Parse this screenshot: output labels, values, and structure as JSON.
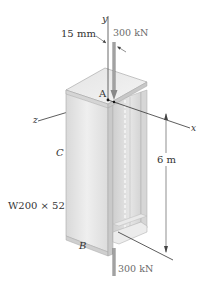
{
  "figure": {
    "type": "engineering-diagram"
  },
  "labels": {
    "y_axis": "y",
    "x_axis": "x",
    "z_axis": "z",
    "point_a": "A",
    "point_b": "B",
    "point_c": "C",
    "offset": "15 mm",
    "load_top": "300 kN",
    "load_bottom": "300 kN",
    "length": "6 m",
    "section": "W200 × 52"
  },
  "colors": {
    "column_light": "#e8e8e8",
    "column_mid": "#d2d2d2",
    "column_dark": "#bdbdbd",
    "edge": "#9a9a9a",
    "axis_line": "#333333",
    "load_arrow": "#8c8c8c",
    "text": "#333333"
  }
}
